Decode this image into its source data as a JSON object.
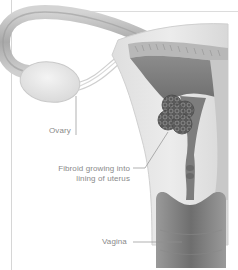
{
  "diagram": {
    "labels": {
      "ovary": "Ovary",
      "fibroid_line1": "Fibroid growing into",
      "fibroid_line2": "lining of uterus",
      "vagina": "Vagina"
    },
    "colors": {
      "background": "#ffffff",
      "frame": "#d6d6d6",
      "label_text": "#8a8a8a",
      "leader_line": "#8f8f8f",
      "tissue_light": "#e6e6e6",
      "tissue_mid": "#bdbdbd",
      "tissue_dark": "#7a7a7a",
      "fibroid": "#5e5e5e"
    }
  }
}
